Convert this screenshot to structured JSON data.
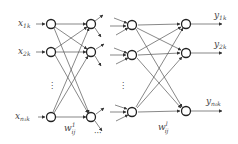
{
  "diagram": {
    "inputs": [
      {
        "label": "x",
        "sub": "1k"
      },
      {
        "label": "x",
        "sub": "2k"
      },
      {
        "label": "x",
        "sub": "n₁k"
      }
    ],
    "outputs": [
      {
        "label": "y",
        "sub": "1k"
      },
      {
        "label": "y",
        "sub": "2k"
      },
      {
        "label": "y",
        "sub": "n₀k"
      }
    ],
    "weights": [
      {
        "label": "w",
        "sub": "ij",
        "sup": "1"
      },
      {
        "label": "w",
        "sub": "ij",
        "sup": "l"
      }
    ],
    "ellipsis_vertical": "⋮",
    "ellipsis_horizontal": "···",
    "colors": {
      "line": "#555555",
      "node": "#222222",
      "text": "#444444"
    }
  }
}
